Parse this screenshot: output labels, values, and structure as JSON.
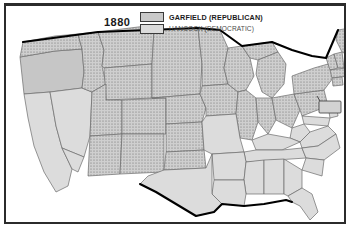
{
  "map": {
    "title_year": "1880",
    "kind": "us-presidential-election-result-map",
    "legend": {
      "entries": [
        {
          "label": "GARFIELD (REPUBLICAN)",
          "pattern": "stipple-dots",
          "swatch_color": "#c9c9c9",
          "emphasis": "bold"
        },
        {
          "label": "HANCOCK (DEMOCRATIC)",
          "pattern": "solid",
          "swatch_color": "#dcdcdc",
          "emphasis": "normal"
        }
      ]
    },
    "colors": {
      "republican_fill": "#c9c9c9",
      "republican_dot": "#5d5d5d",
      "democratic_fill": "#dcdcdc",
      "democratic_fill_dark": "#c6c6c6",
      "state_border": "#6b6b6b",
      "national_border": "#000000",
      "frame": "#2b2b2b",
      "background": "#ffffff"
    },
    "inset": {
      "present": true,
      "shape": "rectangle",
      "leader_line": true
    },
    "regions": {
      "republican": [
        "Washington Territory",
        "Idaho Territory",
        "Montana Territory",
        "Dakota Territory",
        "Wyoming Territory",
        "Utah Territory",
        "Colorado",
        "Arizona Territory",
        "New Mexico Territory",
        "Indian Territory",
        "Kansas",
        "Nebraska",
        "Minnesota",
        "Iowa",
        "Wisconsin",
        "Michigan",
        "Illinois",
        "Indiana",
        "Ohio",
        "Pennsylvania",
        "New York",
        "Vermont",
        "New Hampshire",
        "Maine",
        "Massachusetts",
        "Rhode Island",
        "Connecticut"
      ],
      "democratic": [
        "California",
        "Nevada",
        "Oregon",
        "Texas",
        "Missouri",
        "Arkansas",
        "Louisiana",
        "Mississippi",
        "Alabama",
        "Georgia",
        "Florida",
        "South Carolina",
        "North Carolina",
        "Tennessee",
        "Kentucky",
        "West Virginia",
        "Virginia",
        "Maryland",
        "Delaware",
        "New Jersey"
      ]
    }
  }
}
